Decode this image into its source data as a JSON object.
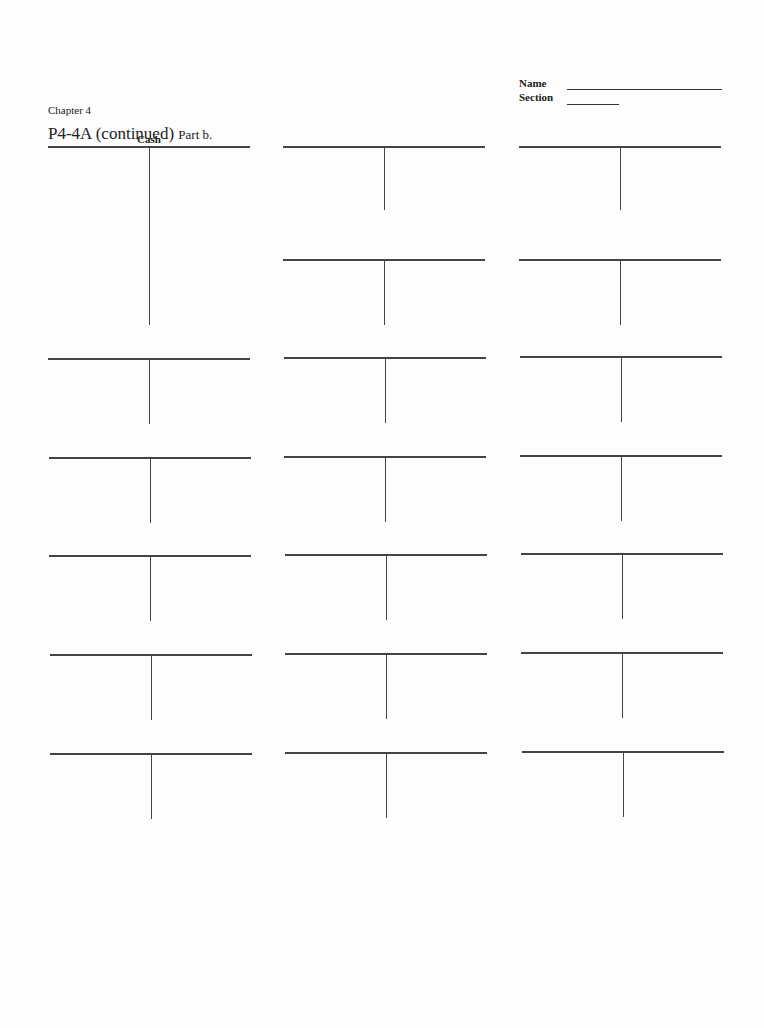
{
  "header": {
    "chapter": "Chapter 4",
    "problem": "P4-4A (continued)",
    "part": "Part b.",
    "name_label": "Name",
    "section_label": "Section"
  },
  "t_accounts": [
    {
      "id": 1,
      "title": "Cash",
      "x": 48,
      "y": 146,
      "height": 179
    },
    {
      "id": 2,
      "title": "",
      "x": 283,
      "y": 146,
      "height": 64
    },
    {
      "id": 3,
      "title": "",
      "x": 519,
      "y": 146,
      "height": 64
    },
    {
      "id": 4,
      "title": "",
      "x": 283,
      "y": 259,
      "height": 66
    },
    {
      "id": 5,
      "title": "",
      "x": 519,
      "y": 259,
      "height": 66
    },
    {
      "id": 6,
      "title": "",
      "x": 48,
      "y": 358,
      "height": 66
    },
    {
      "id": 7,
      "title": "",
      "x": 284,
      "y": 357,
      "height": 66
    },
    {
      "id": 8,
      "title": "",
      "x": 520,
      "y": 356,
      "height": 66
    },
    {
      "id": 9,
      "title": "",
      "x": 49,
      "y": 457,
      "height": 66
    },
    {
      "id": 10,
      "title": "",
      "x": 284,
      "y": 456,
      "height": 66
    },
    {
      "id": 11,
      "title": "",
      "x": 520,
      "y": 455,
      "height": 66
    },
    {
      "id": 12,
      "title": "",
      "x": 49,
      "y": 555,
      "height": 66
    },
    {
      "id": 13,
      "title": "",
      "x": 285,
      "y": 554,
      "height": 66
    },
    {
      "id": 14,
      "title": "",
      "x": 521,
      "y": 553,
      "height": 66
    },
    {
      "id": 15,
      "title": "",
      "x": 50,
      "y": 654,
      "height": 66
    },
    {
      "id": 16,
      "title": "",
      "x": 285,
      "y": 653,
      "height": 66
    },
    {
      "id": 17,
      "title": "",
      "x": 521,
      "y": 652,
      "height": 66
    },
    {
      "id": 18,
      "title": "",
      "x": 50,
      "y": 753,
      "height": 66
    },
    {
      "id": 19,
      "title": "",
      "x": 285,
      "y": 752,
      "height": 66
    },
    {
      "id": 20,
      "title": "",
      "x": 522,
      "y": 751,
      "height": 66
    }
  ]
}
